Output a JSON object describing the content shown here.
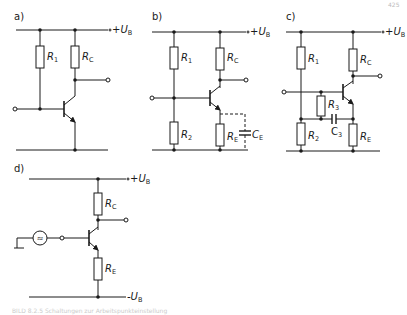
{
  "page_number": "425",
  "panels": [
    {
      "id": "a",
      "label": "a)",
      "components": {
        "R1": "R",
        "R1_sub": "1",
        "RC": "R",
        "RC_sub": "C"
      },
      "supply": {
        "sign": "+",
        "name": "U",
        "sub": "B"
      }
    },
    {
      "id": "b",
      "label": "b)",
      "components": {
        "R1": "R",
        "R1_sub": "1",
        "R2": "R",
        "R2_sub": "2",
        "RC": "R",
        "RC_sub": "C",
        "RE": "R",
        "RE_sub": "E",
        "CE": "C",
        "CE_sub": "E"
      },
      "supply": {
        "sign": "+",
        "name": "U",
        "sub": "B"
      }
    },
    {
      "id": "c",
      "label": "c)",
      "components": {
        "R1": "R",
        "R1_sub": "1",
        "R2": "R",
        "R2_sub": "2",
        "R3": "R",
        "R3_sub": "3",
        "C3": "C",
        "C3_sub": "3",
        "RC": "R",
        "RC_sub": "C",
        "RE": "R",
        "RE_sub": "E"
      },
      "supply": {
        "sign": "+",
        "name": "U",
        "sub": "B"
      }
    },
    {
      "id": "d",
      "label": "d)",
      "components": {
        "RC": "R",
        "RC_sub": "C",
        "RE": "R",
        "RE_sub": "E",
        "source": "≈"
      },
      "supply": {
        "sign": "+",
        "name": "U",
        "sub": "B"
      },
      "supply_neg": {
        "sign": "-",
        "name": "U",
        "sub": "B"
      }
    }
  ],
  "caption": "BILD 8.2.5 Schaltungen zur Arbeitspunkteinstellung"
}
